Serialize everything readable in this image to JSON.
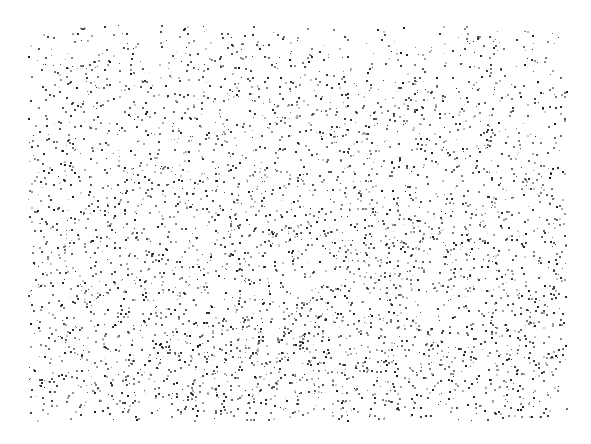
{
  "figure": {
    "width": 591,
    "height": 444,
    "background_color": "#ffffff",
    "title": "",
    "subtitle": "",
    "caption": ""
  },
  "plot_area": {
    "x_min_px": 28,
    "y_min_px": 25,
    "x_max_px": 566,
    "y_max_px": 420,
    "margin_left_px": 28,
    "margin_top_px": 25,
    "margin_right_px": 25,
    "margin_bottom_px": 24
  },
  "marker": {
    "shape": "square",
    "size_px": 2,
    "color": "#1a1a1a",
    "light_color": "#9a9a9a",
    "opacity_range": [
      0.45,
      1.0
    ]
  },
  "chart_data": {
    "type": "scatter",
    "title": "",
    "subtitle": "",
    "xlabel": "",
    "ylabel": "",
    "xlim": [
      0,
      1
    ],
    "ylim": [
      0,
      1
    ],
    "xticks": [],
    "yticks": [],
    "xticklabels": [],
    "yticklabels": [],
    "grid": false,
    "axes_visible": false,
    "legend": false,
    "legend_position": "none",
    "annotations": [],
    "series": [
      {
        "name": "point-cloud",
        "marker": "square",
        "marker_size_px": 2,
        "color": "#1a1a1a",
        "point_count": 4200,
        "description": "Dense random dot field with faint diagonal streak banding",
        "generator": {
          "method": "stratified-jitter-with-diagonal-banding",
          "seed": 20240917,
          "density_gradient": {
            "axis": "y",
            "top_density": 0.52,
            "bottom_density": 1.0,
            "note": "point density increases monotonically toward the bottom of the field"
          },
          "edge_falloff": {
            "left": 0.78,
            "right": 0.9,
            "top": 0.6,
            "bottom": 0.95
          },
          "banding": {
            "orientation": "diagonal",
            "angle_deg": 35,
            "wavelength_px": 18,
            "amplitude": 0.38,
            "wave_distortion_px": 26,
            "wave_period_px": 150
          }
        }
      }
    ]
  }
}
